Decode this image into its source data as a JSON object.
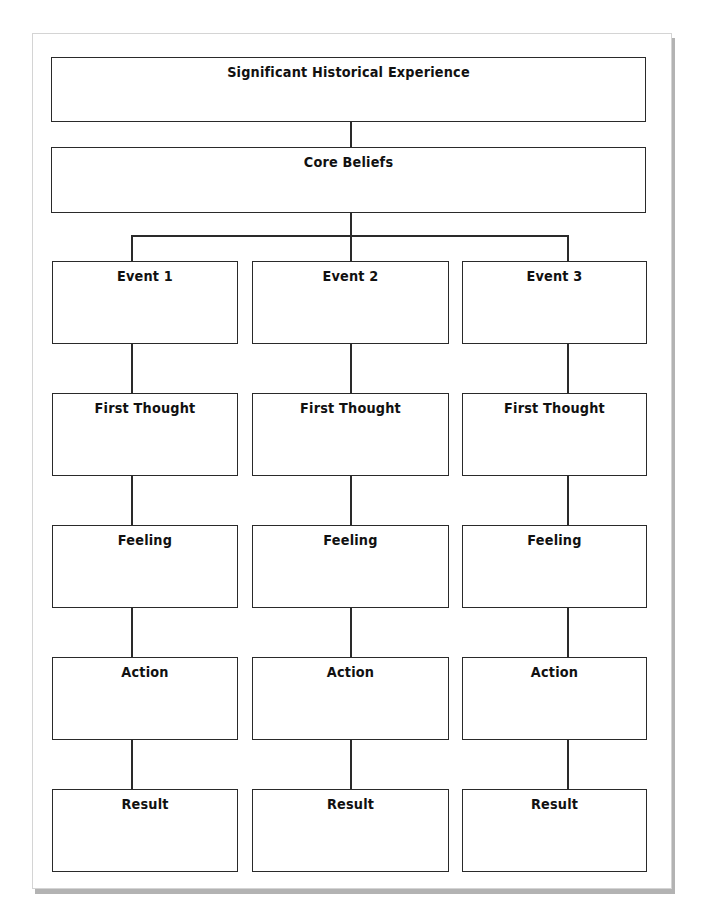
{
  "diagram": {
    "top_boxes": [
      {
        "id": "significant-historical-experience",
        "label": "Significant Historical Experience",
        "content": ""
      },
      {
        "id": "core-beliefs",
        "label": "Core Beliefs",
        "content": ""
      }
    ],
    "columns": [
      {
        "id": "column-1",
        "boxes": [
          {
            "label": "Event 1",
            "content": ""
          },
          {
            "label": "First Thought",
            "content": ""
          },
          {
            "label": "Feeling",
            "content": ""
          },
          {
            "label": "Action",
            "content": ""
          },
          {
            "label": "Result",
            "content": ""
          }
        ]
      },
      {
        "id": "column-2",
        "boxes": [
          {
            "label": "Event 2",
            "content": ""
          },
          {
            "label": "First Thought",
            "content": ""
          },
          {
            "label": "Feeling",
            "content": ""
          },
          {
            "label": "Action",
            "content": ""
          },
          {
            "label": "Result",
            "content": ""
          }
        ]
      },
      {
        "id": "column-3",
        "boxes": [
          {
            "label": "Event 3",
            "content": ""
          },
          {
            "label": "First Thought",
            "content": ""
          },
          {
            "label": "Feeling",
            "content": ""
          },
          {
            "label": "Action",
            "content": ""
          },
          {
            "label": "Result",
            "content": ""
          }
        ]
      }
    ],
    "edges": [
      {
        "from": "Significant Historical Experience",
        "to": "Core Beliefs"
      },
      {
        "from": "Core Beliefs",
        "to": "Event 1"
      },
      {
        "from": "Core Beliefs",
        "to": "Event 2"
      },
      {
        "from": "Core Beliefs",
        "to": "Event 3"
      },
      {
        "from": "Event",
        "to": "First Thought"
      },
      {
        "from": "First Thought",
        "to": "Feeling"
      },
      {
        "from": "Feeling",
        "to": "Action"
      },
      {
        "from": "Action",
        "to": "Result"
      }
    ],
    "colors": {
      "stroke": "#2a2a2a",
      "page_border": "#d4d4d4",
      "page_shadow": "#b3b3b3"
    }
  }
}
